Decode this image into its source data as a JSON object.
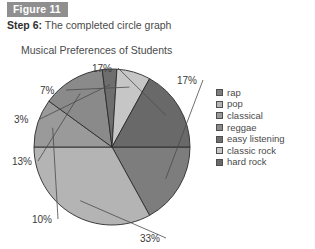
{
  "figure": {
    "tag": "Figure 11",
    "step_label": "Step 6:",
    "step_text": "The completed circle graph"
  },
  "chart_data": {
    "type": "pie",
    "title": "Musical Preferences of Students",
    "xlabel": "",
    "ylabel": "",
    "legend_position": "right",
    "categories": [
      "rap",
      "pop",
      "classical",
      "reggae",
      "easy listening",
      "classic rock",
      "hard rock"
    ],
    "values": [
      17,
      33,
      10,
      13,
      3,
      7,
      17
    ],
    "value_labels": [
      "17%",
      "33%",
      "10%",
      "13%",
      "3%",
      "7%",
      "17%"
    ],
    "colors": [
      "#7d7d7d",
      "#b4b4b4",
      "#9a9a9a",
      "#8a8a8a",
      "#6e6e6e",
      "#c6c6c6",
      "#696969"
    ],
    "start_angle_deg": 0,
    "total": 100
  },
  "colors": {
    "figure_tag_bg": "#8f8f8f",
    "text": "#4a4a4a",
    "slice_outline": "#2b2b2b",
    "page_bg": "#ffffff"
  }
}
